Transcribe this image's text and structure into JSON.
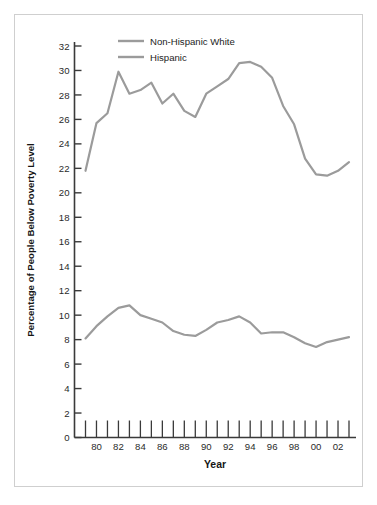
{
  "figure": {
    "border_color": "#cfcfcf",
    "background": "#ffffff"
  },
  "chart_data": {
    "type": "line",
    "title": "",
    "xlabel": "Year",
    "ylabel": "Percentage of People Below Poverty Level",
    "xlim": [
      1979,
      2003
    ],
    "ylim": [
      0,
      32
    ],
    "ytick_step": 2,
    "grid": false,
    "legend_position": "top-center",
    "line_color": "#9b9b9b",
    "x": [
      1979,
      1980,
      1981,
      1982,
      1983,
      1984,
      1985,
      1986,
      1987,
      1988,
      1989,
      1990,
      1991,
      1992,
      1993,
      1994,
      1995,
      1996,
      1997,
      1998,
      1999,
      2000,
      2001,
      2002,
      2003
    ],
    "xticks": [
      1979,
      1980,
      1981,
      1982,
      1983,
      1984,
      1985,
      1986,
      1987,
      1988,
      1989,
      1990,
      1991,
      1992,
      1993,
      1994,
      1995,
      1996,
      1997,
      1998,
      1999,
      2000,
      2001,
      2002,
      2003
    ],
    "xtick_labels": [
      "",
      "80",
      "",
      "82",
      "",
      "84",
      "",
      "86",
      "",
      "88",
      "",
      "90",
      "",
      "92",
      "",
      "94",
      "",
      "96",
      "",
      "98",
      "",
      "00",
      "",
      "02",
      ""
    ],
    "yticks": [
      0,
      2,
      4,
      6,
      8,
      10,
      12,
      14,
      16,
      18,
      20,
      22,
      24,
      26,
      28,
      30,
      32
    ],
    "ytick_labels": [
      "0",
      "2",
      "4",
      "6",
      "8",
      "10",
      "12",
      "14",
      "16",
      "18",
      "20",
      "22",
      "24",
      "26",
      "28",
      "30",
      "32"
    ],
    "series": [
      {
        "name": "Hispanic",
        "color": "#9b9b9b",
        "values": [
          21.8,
          25.7,
          26.5,
          29.9,
          28.1,
          28.4,
          29.0,
          27.3,
          28.1,
          26.7,
          26.2,
          28.1,
          28.7,
          29.3,
          30.6,
          30.7,
          30.3,
          29.4,
          27.1,
          25.6,
          22.8,
          21.5,
          21.4,
          21.8,
          22.5
        ]
      },
      {
        "name": "Non-Hispanic White",
        "color": "#9b9b9b",
        "values": [
          8.1,
          9.1,
          9.9,
          10.6,
          10.8,
          10.0,
          9.7,
          9.4,
          8.7,
          8.4,
          8.3,
          8.8,
          9.4,
          9.6,
          9.9,
          9.4,
          8.5,
          8.6,
          8.6,
          8.2,
          7.7,
          7.4,
          7.8,
          8.0,
          8.2
        ]
      }
    ],
    "legend_entries": [
      {
        "label": "Non-Hispanic White",
        "color": "#9b9b9b"
      },
      {
        "label": "Hispanic",
        "color": "#9b9b9b"
      }
    ]
  }
}
